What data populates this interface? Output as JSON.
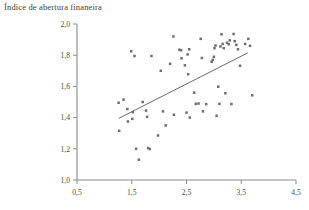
{
  "chart_data": {
    "type": "scatter",
    "title": "Índice de abertura finaneira",
    "xlabel": "",
    "ylabel": "",
    "xlim": [
      0.5,
      4.5
    ],
    "ylim": [
      1.0,
      2.0
    ],
    "xticks": [
      0.5,
      1.5,
      2.5,
      3.5,
      4.5
    ],
    "xtick_labels": [
      "0,5",
      "1,5",
      "2,5",
      "3,5",
      "4,5"
    ],
    "yticks": [
      1.0,
      1.2,
      1.4,
      1.6,
      1.8,
      2.0
    ],
    "ytick_labels": [
      "1,0",
      "1,2",
      "1,4",
      "1,6",
      "1,8",
      "2,0"
    ],
    "grid": false,
    "legend": null,
    "marker": "square",
    "marker_color": "#6e6e72",
    "axis_color": "#8d8d8d",
    "trend_line": {
      "label": "linha de tendência",
      "color": "#6b6b6b",
      "x_start": 1.26,
      "y_start": 1.395,
      "x_end": 3.62,
      "y_end": 1.815
    },
    "points": [
      {
        "x": 1.26,
        "y": 1.495
      },
      {
        "x": 1.35,
        "y": 1.515
      },
      {
        "x": 1.27,
        "y": 1.315
      },
      {
        "x": 1.42,
        "y": 1.455
      },
      {
        "x": 1.43,
        "y": 1.375
      },
      {
        "x": 1.51,
        "y": 1.392
      },
      {
        "x": 1.52,
        "y": 1.435
      },
      {
        "x": 1.49,
        "y": 1.825
      },
      {
        "x": 1.55,
        "y": 1.795
      },
      {
        "x": 1.58,
        "y": 1.2
      },
      {
        "x": 1.63,
        "y": 1.13
      },
      {
        "x": 1.7,
        "y": 1.5
      },
      {
        "x": 1.76,
        "y": 1.445
      },
      {
        "x": 1.8,
        "y": 1.205
      },
      {
        "x": 1.83,
        "y": 1.198
      },
      {
        "x": 1.78,
        "y": 1.405
      },
      {
        "x": 1.86,
        "y": 1.795
      },
      {
        "x": 1.98,
        "y": 1.285
      },
      {
        "x": 2.03,
        "y": 1.7
      },
      {
        "x": 2.07,
        "y": 1.44
      },
      {
        "x": 2.12,
        "y": 1.35
      },
      {
        "x": 2.2,
        "y": 1.745
      },
      {
        "x": 2.26,
        "y": 1.92
      },
      {
        "x": 2.27,
        "y": 1.418
      },
      {
        "x": 2.37,
        "y": 1.835
      },
      {
        "x": 2.4,
        "y": 1.832
      },
      {
        "x": 2.41,
        "y": 1.78
      },
      {
        "x": 2.47,
        "y": 1.735
      },
      {
        "x": 2.52,
        "y": 1.805
      },
      {
        "x": 2.55,
        "y": 1.838
      },
      {
        "x": 2.53,
        "y": 1.678
      },
      {
        "x": 2.5,
        "y": 1.432
      },
      {
        "x": 2.56,
        "y": 1.4
      },
      {
        "x": 2.64,
        "y": 1.56
      },
      {
        "x": 2.67,
        "y": 1.488
      },
      {
        "x": 2.72,
        "y": 1.49
      },
      {
        "x": 2.76,
        "y": 1.905
      },
      {
        "x": 2.78,
        "y": 1.782
      },
      {
        "x": 2.8,
        "y": 1.44
      },
      {
        "x": 2.86,
        "y": 1.486
      },
      {
        "x": 2.96,
        "y": 1.758
      },
      {
        "x": 2.98,
        "y": 1.77
      },
      {
        "x": 3.0,
        "y": 1.79
      },
      {
        "x": 3.01,
        "y": 1.845
      },
      {
        "x": 3.03,
        "y": 1.862
      },
      {
        "x": 3.05,
        "y": 1.412
      },
      {
        "x": 3.08,
        "y": 1.598
      },
      {
        "x": 3.1,
        "y": 1.488
      },
      {
        "x": 3.12,
        "y": 1.856
      },
      {
        "x": 3.14,
        "y": 1.934
      },
      {
        "x": 3.16,
        "y": 1.872
      },
      {
        "x": 3.18,
        "y": 1.845
      },
      {
        "x": 3.21,
        "y": 1.556
      },
      {
        "x": 3.24,
        "y": 1.88
      },
      {
        "x": 3.27,
        "y": 1.87
      },
      {
        "x": 3.29,
        "y": 1.895
      },
      {
        "x": 3.32,
        "y": 1.487
      },
      {
        "x": 3.36,
        "y": 1.936
      },
      {
        "x": 3.38,
        "y": 1.89
      },
      {
        "x": 3.41,
        "y": 1.866
      },
      {
        "x": 3.44,
        "y": 1.838
      },
      {
        "x": 3.48,
        "y": 1.732
      },
      {
        "x": 3.57,
        "y": 1.872
      },
      {
        "x": 3.63,
        "y": 1.905
      },
      {
        "x": 3.7,
        "y": 1.543
      },
      {
        "x": 3.66,
        "y": 1.86
      }
    ]
  }
}
